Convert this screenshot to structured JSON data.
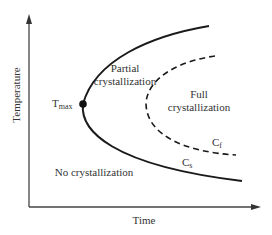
{
  "diagram": {
    "type": "crystallization-regions",
    "axes": {
      "x_label": "Time",
      "y_label": "Temperature"
    },
    "regions": {
      "partial_line1": "Partial",
      "partial_line2": "crystallization",
      "full_line1": "Full",
      "full_line2": "crystallization",
      "none": "No crystallization"
    },
    "curves": {
      "start": {
        "label_main": "C",
        "label_sub": "s",
        "style": "solid"
      },
      "finish": {
        "label_main": "C",
        "label_sub": "f",
        "style": "dashed"
      }
    },
    "point": {
      "label_main": "T",
      "label_sub": "max"
    },
    "colors": {
      "line": "#1a1a1a",
      "text": "#333333",
      "axis": "#444444"
    }
  }
}
